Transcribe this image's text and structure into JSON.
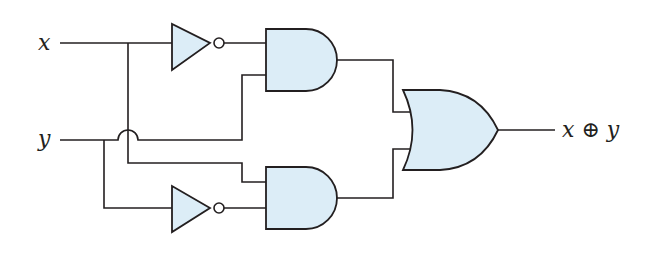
{
  "diagram": {
    "title": "",
    "type": "logic-circuit",
    "colors": {
      "gate_fill": "#dcedf7",
      "stroke": "#231f20",
      "background": "#ffffff"
    },
    "inputs": [
      {
        "id": "x",
        "label": "x"
      },
      {
        "id": "y",
        "label": "y"
      }
    ],
    "output": {
      "id": "out",
      "label": "x ⊕ y"
    },
    "gates": [
      {
        "id": "not1",
        "type": "NOT",
        "input": "x"
      },
      {
        "id": "and1",
        "type": "AND",
        "inputs": [
          "not1",
          "y"
        ]
      },
      {
        "id": "not2",
        "type": "NOT",
        "input": "y"
      },
      {
        "id": "and2",
        "type": "AND",
        "inputs": [
          "x",
          "not2"
        ]
      },
      {
        "id": "or1",
        "type": "OR",
        "inputs": [
          "and1",
          "and2"
        ]
      }
    ],
    "crossovers": [
      {
        "at": "x-branch over y-wire",
        "style": "jump-arc"
      }
    ]
  }
}
